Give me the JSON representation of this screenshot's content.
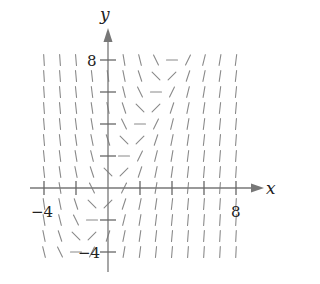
{
  "figure": {
    "type": "slope_field",
    "x_axis_label": "x",
    "y_axis_label": "y",
    "x_tick_labels": [
      {
        "value": -4,
        "text": "−4"
      },
      {
        "value": 8,
        "text": "8"
      }
    ],
    "y_tick_labels": [
      {
        "value": 8,
        "text": "8"
      },
      {
        "value": -4,
        "text": "−4"
      }
    ],
    "x_ticks": [
      -4,
      -2,
      2,
      4,
      6,
      8
    ],
    "y_ticks": [
      -4,
      -2,
      2,
      4,
      6,
      8
    ],
    "x_range": [
      -4,
      8
    ],
    "y_range": [
      -4,
      8
    ],
    "grid_step": 1,
    "colors": {
      "segments": "#8a8a8a",
      "axes": "#777777",
      "text": "#222222"
    },
    "slope_rows": {
      "description": "slopes[row][col]; rows y=8 down to y=-4, cols x=-4..8 (fits dy/dx = 2x - y)",
      "y_values": [
        8,
        7,
        6,
        5,
        4,
        3,
        2,
        1,
        0,
        -1,
        -2,
        -3,
        -4
      ],
      "x_values": [
        -4,
        -3,
        -2,
        -1,
        0,
        1,
        2,
        3,
        4,
        5,
        6,
        7,
        8
      ],
      "slopes": [
        [
          -16,
          -14,
          -12,
          -10,
          -8,
          -6,
          -4,
          -2,
          0,
          2,
          4,
          6,
          8
        ],
        [
          -15,
          -13,
          -11,
          -9,
          -7,
          -5,
          -3,
          -1,
          1,
          3,
          5,
          7,
          9
        ],
        [
          -14,
          -12,
          -10,
          -8,
          -6,
          -4,
          -2,
          0,
          2,
          4,
          6,
          8,
          10
        ],
        [
          -13,
          -11,
          -9,
          -7,
          -5,
          -3,
          -1,
          1,
          3,
          5,
          7,
          9,
          11
        ],
        [
          -12,
          -10,
          -8,
          -6,
          -4,
          -2,
          0,
          2,
          4,
          6,
          8,
          10,
          12
        ],
        [
          -11,
          -9,
          -7,
          -5,
          -3,
          -1,
          1,
          3,
          5,
          7,
          9,
          11,
          13
        ],
        [
          -10,
          -8,
          -6,
          -4,
          -2,
          0,
          2,
          4,
          6,
          8,
          10,
          12,
          14
        ],
        [
          -9,
          -7,
          -5,
          -3,
          -1,
          1,
          3,
          5,
          7,
          9,
          11,
          13,
          15
        ],
        [
          -8,
          -6,
          -4,
          -2,
          0,
          2,
          4,
          6,
          8,
          10,
          12,
          14,
          16
        ],
        [
          -7,
          -5,
          -3,
          -1,
          1,
          3,
          5,
          7,
          9,
          11,
          13,
          15,
          17
        ],
        [
          -6,
          -4,
          -2,
          0,
          2,
          4,
          6,
          8,
          10,
          12,
          14,
          16,
          18
        ],
        [
          -5,
          -3,
          -1,
          1,
          3,
          5,
          7,
          9,
          11,
          13,
          15,
          17,
          19
        ],
        [
          -4,
          -2,
          0,
          2,
          4,
          6,
          8,
          10,
          12,
          14,
          16,
          18,
          20
        ]
      ],
      "hidden_points": [
        [
          -1,
          8
        ]
      ]
    }
  }
}
